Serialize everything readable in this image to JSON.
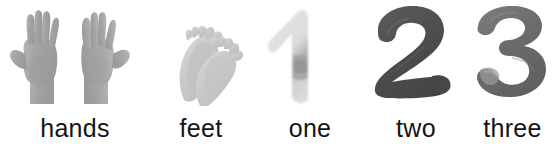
{
  "page": {
    "background_color": "#ffffff",
    "width": 557,
    "height": 149
  },
  "items": [
    {
      "id": "hands",
      "label": "hands",
      "figure_kind": "photo-hands",
      "figure_description": "two open human hands, palms forward, grayscale photograph",
      "count": 2,
      "ink_color": "#a9a9a9",
      "shadow_color": "#8c8c8c"
    },
    {
      "id": "feet",
      "label": "feet",
      "figure_kind": "photo-feet",
      "figure_description": "two bare human feet crossed, pale grayscale photograph",
      "count": 2,
      "ink_color": "#c9c9c9",
      "shadow_color": "#b0b0b0"
    },
    {
      "id": "one",
      "label": "one",
      "figure_kind": "brush-numeral",
      "figure_description": "brush-painted numeral 1, very pale gray with darker smudge",
      "numeral": "1",
      "ink_color": "#dcdcdc",
      "shadow_color": "#9a9a9a"
    },
    {
      "id": "two",
      "label": "two",
      "figure_kind": "brush-numeral",
      "figure_description": "brush-painted numeral 2, dark charcoal gray",
      "numeral": "2",
      "ink_color": "#4f4f4f",
      "shadow_color": "#3c3c3c"
    },
    {
      "id": "three",
      "label": "three",
      "figure_kind": "brush-numeral",
      "figure_description": "brush-painted numeral 3, medium gray",
      "numeral": "3",
      "ink_color": "#6d6d6d",
      "shadow_color": "#585858"
    }
  ]
}
